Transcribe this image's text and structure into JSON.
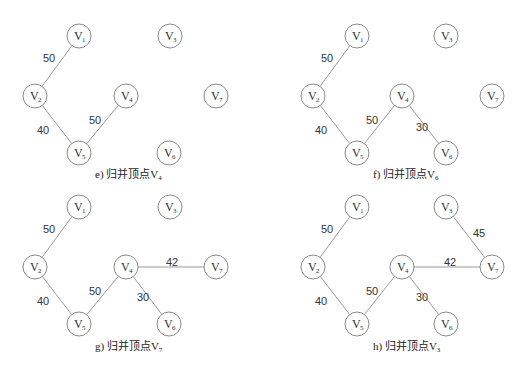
{
  "node_radius": 12,
  "panels": [
    {
      "id": "e",
      "caption_prefix": "e) 归并顶点V",
      "caption_sub": "4",
      "caption_pos": [
        125,
        178
      ],
      "nodes": [
        {
          "id": "V1",
          "sub": "1",
          "x": 79,
          "y": 36
        },
        {
          "id": "V2",
          "sub": "2",
          "x": 35,
          "y": 96
        },
        {
          "id": "V3",
          "sub": "3",
          "x": 170,
          "y": 36
        },
        {
          "id": "V4",
          "sub": "4",
          "x": 126,
          "y": 96
        },
        {
          "id": "V5",
          "sub": "5",
          "x": 79,
          "y": 153
        },
        {
          "id": "V6",
          "sub": "6",
          "x": 169,
          "y": 153
        },
        {
          "id": "V7",
          "sub": "7",
          "x": 216,
          "y": 96
        }
      ],
      "edges": [
        {
          "from": "V1",
          "to": "V2",
          "weight": "50",
          "lx": 43,
          "ly": 62
        },
        {
          "from": "V2",
          "to": "V5",
          "weight": "40",
          "lx": 37,
          "ly": 134
        },
        {
          "from": "V5",
          "to": "V4",
          "weight": "50",
          "lx": 89,
          "ly": 124
        }
      ]
    },
    {
      "id": "f",
      "caption_prefix": "f) 归并顶点V",
      "caption_sub": "6",
      "caption_pos": [
        403,
        178
      ],
      "nodes": [
        {
          "id": "V1",
          "sub": "1",
          "x": 357,
          "y": 36
        },
        {
          "id": "V2",
          "sub": "2",
          "x": 313,
          "y": 96
        },
        {
          "id": "V3",
          "sub": "3",
          "x": 446,
          "y": 36
        },
        {
          "id": "V4",
          "sub": "4",
          "x": 402,
          "y": 96
        },
        {
          "id": "V5",
          "sub": "5",
          "x": 357,
          "y": 153
        },
        {
          "id": "V6",
          "sub": "6",
          "x": 446,
          "y": 153
        },
        {
          "id": "V7",
          "sub": "7",
          "x": 492,
          "y": 96
        }
      ],
      "edges": [
        {
          "from": "V1",
          "to": "V2",
          "weight": "50",
          "lx": 321,
          "ly": 62
        },
        {
          "from": "V2",
          "to": "V5",
          "weight": "40",
          "lx": 315,
          "ly": 134
        },
        {
          "from": "V5",
          "to": "V4",
          "weight": "50",
          "lx": 366,
          "ly": 124
        },
        {
          "from": "V4",
          "to": "V6",
          "weight": "30",
          "lx": 416,
          "ly": 131
        }
      ]
    },
    {
      "id": "g",
      "caption_prefix": "g) 归并顶点V",
      "caption_sub": "7",
      "caption_pos": [
        125,
        350
      ],
      "nodes": [
        {
          "id": "V1",
          "sub": "1",
          "x": 79,
          "y": 207
        },
        {
          "id": "V2",
          "sub": "2",
          "x": 35,
          "y": 267
        },
        {
          "id": "V3",
          "sub": "3",
          "x": 170,
          "y": 207
        },
        {
          "id": "V4",
          "sub": "4",
          "x": 126,
          "y": 267
        },
        {
          "id": "V5",
          "sub": "5",
          "x": 79,
          "y": 324
        },
        {
          "id": "V6",
          "sub": "6",
          "x": 169,
          "y": 324
        },
        {
          "id": "V7",
          "sub": "7",
          "x": 216,
          "y": 267
        }
      ],
      "edges": [
        {
          "from": "V1",
          "to": "V2",
          "weight": "50",
          "lx": 43,
          "ly": 233
        },
        {
          "from": "V2",
          "to": "V5",
          "weight": "40",
          "lx": 37,
          "ly": 305
        },
        {
          "from": "V5",
          "to": "V4",
          "weight": "50",
          "lx": 89,
          "ly": 295
        },
        {
          "from": "V4",
          "to": "V6",
          "weight": "30",
          "lx": 137,
          "ly": 301
        },
        {
          "from": "V4",
          "to": "V7",
          "weight": "42",
          "lx": 166,
          "ly": 266
        }
      ]
    },
    {
      "id": "h",
      "caption_prefix": "h) 归并顶点V",
      "caption_sub": "3",
      "caption_pos": [
        403,
        350
      ],
      "nodes": [
        {
          "id": "V1",
          "sub": "1",
          "x": 357,
          "y": 207
        },
        {
          "id": "V2",
          "sub": "2",
          "x": 313,
          "y": 267
        },
        {
          "id": "V3",
          "sub": "3",
          "x": 446,
          "y": 207
        },
        {
          "id": "V4",
          "sub": "4",
          "x": 402,
          "y": 267
        },
        {
          "id": "V5",
          "sub": "5",
          "x": 357,
          "y": 324
        },
        {
          "id": "V6",
          "sub": "6",
          "x": 446,
          "y": 324
        },
        {
          "id": "V7",
          "sub": "7",
          "x": 492,
          "y": 267
        }
      ],
      "edges": [
        {
          "from": "V1",
          "to": "V2",
          "weight": "50",
          "lx": 321,
          "ly": 233
        },
        {
          "from": "V2",
          "to": "V5",
          "weight": "40",
          "lx": 315,
          "ly": 305
        },
        {
          "from": "V5",
          "to": "V4",
          "weight": "50",
          "lx": 366,
          "ly": 295
        },
        {
          "from": "V4",
          "to": "V6",
          "weight": "30",
          "lx": 416,
          "ly": 301
        },
        {
          "from": "V4",
          "to": "V7",
          "weight": "42",
          "lx": 444,
          "ly": 266
        },
        {
          "from": "V3",
          "to": "V7",
          "weight": "45",
          "lx": 473,
          "ly": 237
        }
      ]
    }
  ]
}
